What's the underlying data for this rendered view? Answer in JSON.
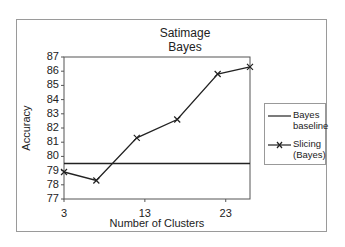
{
  "chart_data": {
    "type": "line",
    "title_lines": [
      "Satimage",
      "Bayes"
    ],
    "xlabel": "Number of Clusters",
    "ylabel": "Accuracy",
    "xlim": [
      3,
      26
    ],
    "ylim": [
      77,
      87
    ],
    "x_ticks": [
      "3",
      "13",
      "23"
    ],
    "y_ticks": [
      "77",
      "78",
      "79",
      "80",
      "81",
      "82",
      "83",
      "84",
      "85",
      "86",
      "87"
    ],
    "grid": false,
    "legend_position": "right",
    "series": [
      {
        "name": "Bayes baseline",
        "legend_lines": [
          "Bayes",
          "baseline"
        ],
        "marker": "none",
        "x": [
          3,
          26
        ],
        "values": [
          79.5,
          79.5
        ]
      },
      {
        "name": "Slicing (Bayes)",
        "legend_lines": [
          "Slicing",
          "(Bayes)"
        ],
        "marker": "x",
        "x": [
          3,
          7,
          12,
          17,
          22,
          26
        ],
        "values": [
          78.9,
          78.3,
          81.3,
          82.6,
          85.8,
          86.3
        ]
      }
    ]
  }
}
